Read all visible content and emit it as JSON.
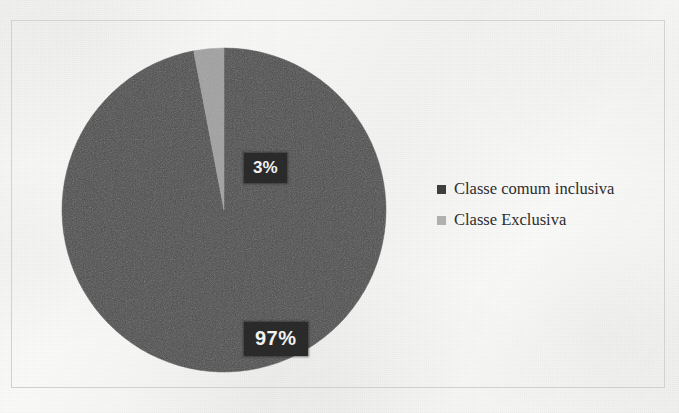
{
  "figure": {
    "background_color": "#f6f6f4",
    "frame_color": "#d2d2d2"
  },
  "chart_data": {
    "type": "pie",
    "title": "",
    "subtitle": "",
    "xlabel": "",
    "ylabel": "",
    "grid": false,
    "legend_position": "right",
    "start_angle_deg": 0,
    "direction": "counterclockwise",
    "categories": [
      "Classe comum inclusiva",
      "Classe Exclusiva"
    ],
    "values": [
      97,
      3
    ],
    "value_unit": "%",
    "data_labels": [
      "97%",
      "3%"
    ],
    "slice_colors": [
      "#4a4a4a",
      "#a0a0a0"
    ],
    "annotations": []
  },
  "pie": {
    "slices": [
      {
        "name": "Classe comum inclusiva",
        "value": 97,
        "label": "97%",
        "color": "#4a4a4a"
      },
      {
        "name": "Classe Exclusiva",
        "value": 3,
        "label": "3%",
        "color": "#a0a0a0"
      }
    ],
    "label_text_color": "#f2f2f2",
    "label_box_color": "#2a2a2a"
  },
  "legend": {
    "items": [
      {
        "label": "Classe comum inclusiva",
        "color": "#3f3f3f"
      },
      {
        "label": "Classe Exclusiva",
        "color": "#b0b0b0"
      }
    ]
  }
}
